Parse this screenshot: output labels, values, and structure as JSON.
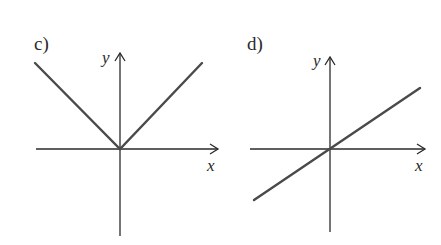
{
  "panels": [
    {
      "label": "c)",
      "x_axis_label": "x",
      "y_axis_label": "y",
      "function": "absolute value, V-shape through origin (y = |x|)"
    },
    {
      "label": "d)",
      "x_axis_label": "x",
      "y_axis_label": "y",
      "function": "straight line through origin with positive slope (y = kx, k≈0.67)"
    }
  ],
  "colors": {
    "axis": "#2a2a2a",
    "graph": "#4a4a4a",
    "background": "#ffffff"
  }
}
